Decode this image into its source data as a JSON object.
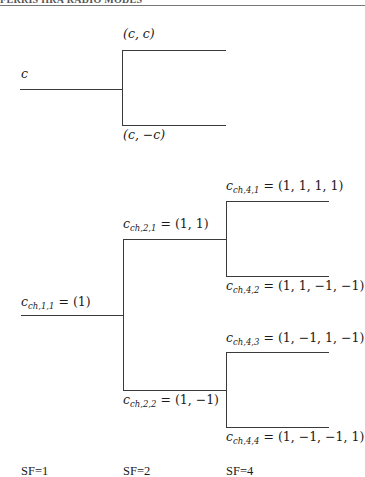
{
  "header": {
    "text": "FERRIS HRA RADIO MODES"
  },
  "top_tree": {
    "root_label": "c",
    "upper_branch_label": "(c, c)",
    "lower_branch_label": "(c, −c)"
  },
  "ovsf_tree": {
    "nodes": [
      {
        "id": "ch_1_1",
        "symbol": "c",
        "subscript": "ch,1,1",
        "value": "= (1)"
      },
      {
        "id": "ch_2_1",
        "symbol": "c",
        "subscript": "ch,2,1",
        "value": "= (1, 1)"
      },
      {
        "id": "ch_2_2",
        "symbol": "c",
        "subscript": "ch,2,2",
        "value": "= (1, −1)"
      },
      {
        "id": "ch_4_1",
        "symbol": "c",
        "subscript": "ch,4,1",
        "value": "= (1, 1, 1, 1)"
      },
      {
        "id": "ch_4_2",
        "symbol": "c",
        "subscript": "ch,4,2",
        "value": "= (1, 1, −1, −1)"
      },
      {
        "id": "ch_4_3",
        "symbol": "c",
        "subscript": "ch,4,3",
        "value": "= (1, −1, 1, −1)"
      },
      {
        "id": "ch_4_4",
        "symbol": "c",
        "subscript": "ch,4,4",
        "value": "= (1, −1, −1, 1)"
      }
    ]
  },
  "spreading_factors": [
    "SF=1",
    "SF=2",
    "SF=4"
  ]
}
